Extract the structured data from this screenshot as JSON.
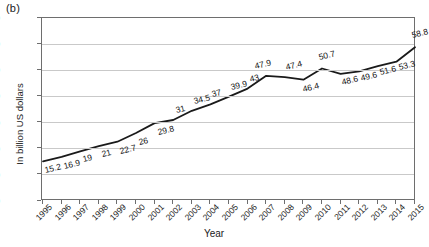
{
  "panel": {
    "label": "(b)"
  },
  "chart_data": {
    "type": "line",
    "title": "",
    "xlabel": "Year",
    "ylabel": "In billion US dollars",
    "xlim": [
      1995,
      2015
    ],
    "ylim": [
      0,
      70
    ],
    "ytick_step": 10,
    "grid": true,
    "legend": "none",
    "line_color": "#1a1a1a",
    "categories": [
      "1995",
      "1996",
      "1997",
      "1998",
      "1999",
      "2000",
      "2001",
      "2002",
      "2003",
      "2004",
      "2005",
      "2006",
      "2007",
      "2008",
      "2009",
      "2010",
      "2011",
      "2012",
      "2013",
      "2014",
      "2015"
    ],
    "yticks": [
      "0",
      "10",
      "20",
      "30",
      "40",
      "50",
      "60",
      "70"
    ],
    "values": [
      15.2,
      16.9,
      19,
      21,
      22.7,
      26,
      29.8,
      31,
      34.5,
      37,
      39.9,
      43,
      47.9,
      47.4,
      46.4,
      50.7,
      48.6,
      49.6,
      51.6,
      53.3,
      58.8
    ],
    "point_labels": [
      "15.2",
      "16.9",
      "19",
      "21",
      "22.7",
      "26",
      "29.8",
      "31",
      "34.5",
      "37",
      "39.9",
      "43",
      "47.9",
      "47.4",
      "46.4",
      "50.7",
      "48.6",
      "49.6",
      "51.6",
      "53.3",
      "58.8"
    ],
    "label_offsets": [
      [
        3,
        13
      ],
      [
        3,
        13
      ],
      [
        4,
        12
      ],
      [
        4,
        12
      ],
      [
        4,
        13
      ],
      [
        4,
        13
      ],
      [
        4,
        13
      ],
      [
        4,
        -6
      ],
      [
        3,
        -6
      ],
      [
        3,
        -6
      ],
      [
        3,
        -6
      ],
      [
        3,
        -6
      ],
      [
        -10,
        -6
      ],
      [
        2,
        -6
      ],
      [
        1,
        13
      ],
      [
        -2,
        -7
      ],
      [
        2,
        12
      ],
      [
        3,
        11
      ],
      [
        3,
        10
      ],
      [
        4,
        9
      ],
      [
        -2,
        -8
      ]
    ]
  }
}
